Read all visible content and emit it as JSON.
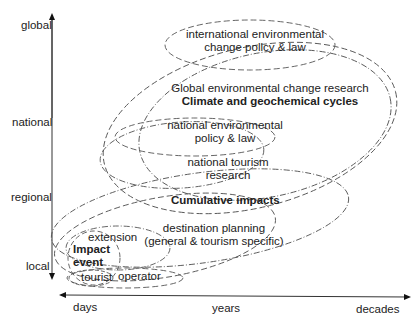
{
  "diagram": {
    "y_axis": {
      "direction": "bidirectional",
      "labels": [
        "global",
        "national",
        "regional",
        "local"
      ]
    },
    "x_axis": {
      "direction": "bidirectional",
      "labels": [
        "days",
        "years",
        "decades"
      ]
    },
    "regions": [
      {
        "id": "intl_policy",
        "line1": "international environmental",
        "line2": "change policy & law"
      },
      {
        "id": "global_research",
        "line1": "Global environmental change research"
      },
      {
        "id": "climate",
        "line1": "Climate and geochemical cycles",
        "bold": true
      },
      {
        "id": "national_policy",
        "line1": "national environmental",
        "line2": "policy & law"
      },
      {
        "id": "national_tourism",
        "line1": "national tourism",
        "line2": "research"
      },
      {
        "id": "cumulative",
        "line1": "Cumulative impacts",
        "bold": true
      },
      {
        "id": "destination",
        "line1": "destination planning",
        "line2": "(general & tourism specific)"
      },
      {
        "id": "extension",
        "line1": "extension"
      },
      {
        "id": "impact_event",
        "line1": "Impact",
        "line2": "event",
        "bold": true
      },
      {
        "id": "tourist",
        "line1": "tourist"
      },
      {
        "id": "operator",
        "line1": "operator"
      }
    ],
    "line_color": "#555555"
  }
}
